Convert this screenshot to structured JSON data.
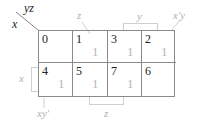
{
  "diagram": {
    "type": "karnaugh-map",
    "corner": {
      "row_var": "x",
      "col_var": "yz"
    },
    "columns": [
      "00",
      "01",
      "11",
      "10"
    ],
    "rows": [
      "0",
      "1"
    ],
    "cells": [
      {
        "index": "0",
        "value": ""
      },
      {
        "index": "1",
        "value": "1"
      },
      {
        "index": "3",
        "value": "1"
      },
      {
        "index": "2",
        "value": "1"
      },
      {
        "index": "4",
        "value": "1"
      },
      {
        "index": "5",
        "value": "1"
      },
      {
        "index": "7",
        "value": "1"
      },
      {
        "index": "6",
        "value": ""
      }
    ],
    "labels": {
      "top_z": "z",
      "top_y": "y",
      "top_xpy": "x'y",
      "left_x": "x",
      "bottom_xyp": "xy'",
      "bottom_z": "z"
    },
    "colors": {
      "grid": "#8a8a8a",
      "annotation": "#b0b0b0",
      "text": "#222222"
    }
  }
}
